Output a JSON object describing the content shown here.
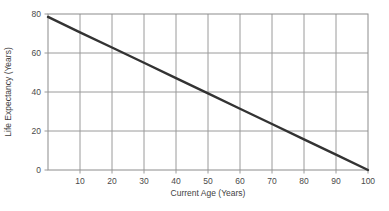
{
  "chart_data": {
    "type": "line",
    "title": "",
    "subtitle": "",
    "xlabel": "Current Age (Years)",
    "ylabel": "Life Expectancy (Years)",
    "xlim": [
      0,
      100
    ],
    "ylim": [
      0,
      80
    ],
    "xticks": [
      10,
      20,
      30,
      40,
      50,
      60,
      70,
      80,
      90,
      100
    ],
    "xtick_labels": [
      "10",
      "20",
      "30",
      "40",
      "50",
      "60",
      "70",
      "80",
      "90",
      "100"
    ],
    "yticks": [
      0,
      20,
      40,
      60,
      80
    ],
    "ytick_labels": [
      "0",
      "20",
      "40",
      "60",
      "80"
    ],
    "grid": true,
    "legend": false,
    "legend_position": "none",
    "series": [
      {
        "name": "Life Expectancy",
        "color": "#333333",
        "line_width": 2.4,
        "x": [
          0,
          10,
          20,
          30,
          40,
          50,
          60,
          70,
          80,
          90,
          100
        ],
        "values": [
          78.5,
          70.6,
          62.8,
          55.0,
          47.1,
          39.3,
          31.4,
          23.6,
          15.7,
          7.9,
          0
        ]
      }
    ],
    "annotations": [],
    "colors": {
      "line": "#333333",
      "grid": "#9a9a9a",
      "axis": "#8c8c8c",
      "text": "#4a4a4a",
      "background": "#ffffff"
    }
  }
}
